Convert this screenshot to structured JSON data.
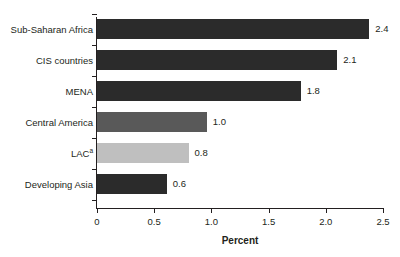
{
  "chart_data": {
    "type": "bar",
    "orientation": "horizontal",
    "title": "",
    "xlabel": "Percent",
    "ylabel": "",
    "xlim": [
      0,
      2.5
    ],
    "xticks": [
      "0",
      "0.5",
      "1.0",
      "1.5",
      "2.0",
      "2.5"
    ],
    "xtick_values": [
      0,
      0.5,
      1.0,
      1.5,
      2.0,
      2.5
    ],
    "grid": false,
    "legend": false,
    "categories": [
      "Sub-Saharan Africa",
      "CIS countries",
      "MENA",
      "Central America",
      "LAC",
      "Developing Asia"
    ],
    "category_superscripts": [
      "",
      "",
      "",
      "",
      "a",
      ""
    ],
    "values": [
      2.4,
      2.1,
      1.8,
      1.0,
      0.8,
      0.6
    ],
    "value_labels": [
      "2.4",
      "2.1",
      "1.8",
      "1.0",
      "0.8",
      "0.6"
    ],
    "bar_colors": [
      "#2b2b2b",
      "#2b2b2b",
      "#2b2b2b",
      "#595959",
      "#bfbfbf",
      "#2b2b2b"
    ],
    "bar_plot_widths": [
      2.38,
      2.1,
      1.78,
      0.96,
      0.8,
      0.61
    ],
    "colors": {
      "dark": "#2b2b2b",
      "medium": "#595959",
      "light": "#bfbfbf",
      "axis": "#231f20",
      "background": "#ffffff"
    }
  },
  "figure": {
    "title_remnant": "",
    "axis_title": "Percent"
  }
}
